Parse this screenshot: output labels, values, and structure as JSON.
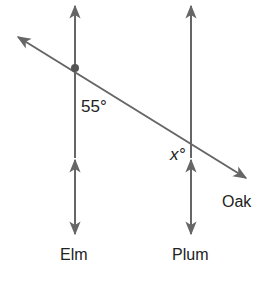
{
  "diagram": {
    "type": "geometry-transversal",
    "lines": [
      {
        "name": "Elm",
        "label": "Elm",
        "orientation": "vertical"
      },
      {
        "name": "Plum",
        "label": "Plum",
        "orientation": "vertical"
      },
      {
        "name": "Oak",
        "label": "Oak",
        "orientation": "transversal"
      }
    ],
    "angles": [
      {
        "label": "55°",
        "at": "Elm-Oak intersection"
      },
      {
        "label": "x°",
        "at": "Plum-Oak intersection"
      }
    ],
    "colors": {
      "line": "#666666",
      "text": "#222222",
      "point": "#555555"
    }
  }
}
